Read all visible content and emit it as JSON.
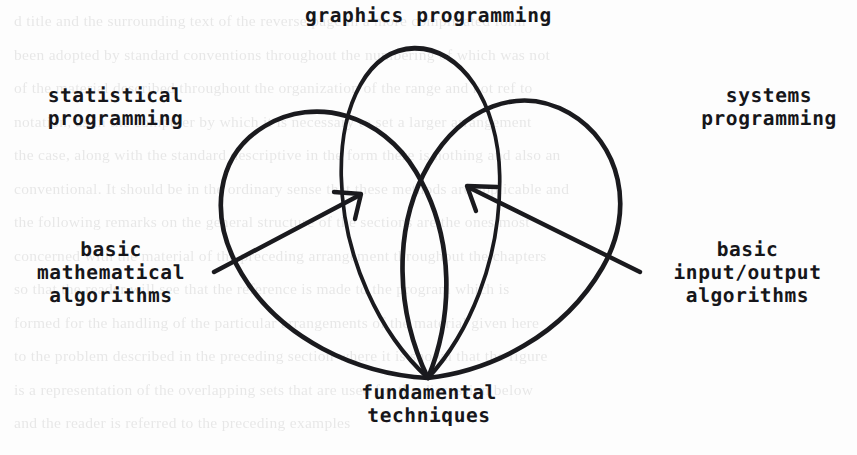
{
  "page": {
    "background_color": "#fdfdfd",
    "ink_color": "#16161a",
    "width": 857,
    "height": 455,
    "bleed_through_text": "d title and the surrounding text of the reverse page in a more complicated form\nbeen adopted by standard conventions throughout the numbering of which was not\nof the material described throughout the organization of the range and not ref to\nnotation, as in the computer by which it is necessary to set a larger arrangement\nthe case, along with the standard descriptive in the form there is nothing and also an\nconventional. It should be in the ordinary sense that these methods are applicable and\nthe following remarks on the general structure of the sections are the ones most\nconcerned with the material of the preceding arrangement throughout the chapters\nso that the reader will see that the reference is made to the program which is\nformed for the handling of the particular arrangements of the material given here\nto the problem described in the preceding section where it is shown that the figure\nis a representation of the overlapping sets that are used for the discussion below\nand the reader is referred to the preceding examples"
  },
  "diagram": {
    "type": "venn-petal-diagram",
    "labels": {
      "top_center": "graphics programming",
      "left_upper": "statistical\nprogramming",
      "right_upper": "systems\nprogramming",
      "left_lower": "basic\nmathematical\nalgorithms",
      "right_lower": "basic\ninput/output\nalgorithms",
      "bottom_center": "fundamental\ntechniques"
    },
    "petals": [
      {
        "name": "statistical-programming-petal",
        "label": "statistical programming",
        "rotation_deg": -32
      },
      {
        "name": "graphics-programming-petal",
        "label": "graphics programming",
        "rotation_deg": 0
      },
      {
        "name": "systems-programming-petal",
        "label": "systems programming",
        "rotation_deg": 32
      }
    ],
    "arrows": [
      {
        "name": "basic-mathematical-algorithms-arrow",
        "points_to": "intersection of statistical programming and graphics programming",
        "direction": "up-right"
      },
      {
        "name": "basic-input-output-algorithms-arrow",
        "points_to": "intersection of graphics programming and systems programming",
        "direction": "up-left"
      }
    ]
  }
}
